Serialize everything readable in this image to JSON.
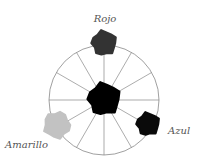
{
  "diagram": {
    "type": "color-wheel",
    "wheel": {
      "cx": 104,
      "cy": 100,
      "r": 55,
      "segments": 12,
      "stroke": "#888888"
    },
    "center": {
      "name": "center-mix",
      "cx": 104,
      "cy": 99,
      "r": 17,
      "color": "#000000"
    },
    "primaries": [
      {
        "id": "rojo",
        "label": "Rojo",
        "cx": 104,
        "cy": 43,
        "r": 13,
        "color": "#333333",
        "lx": 105,
        "ly": 22
      },
      {
        "id": "azul",
        "label": "Azul",
        "cx": 148,
        "cy": 124,
        "r": 12,
        "color": "#0a0a0a",
        "lx": 168,
        "ly": 134
      },
      {
        "id": "amarillo",
        "label": "Amarillo",
        "cx": 57,
        "cy": 125,
        "r": 14,
        "color": "#c2c2c2",
        "lx": 5,
        "ly": 148
      }
    ]
  }
}
